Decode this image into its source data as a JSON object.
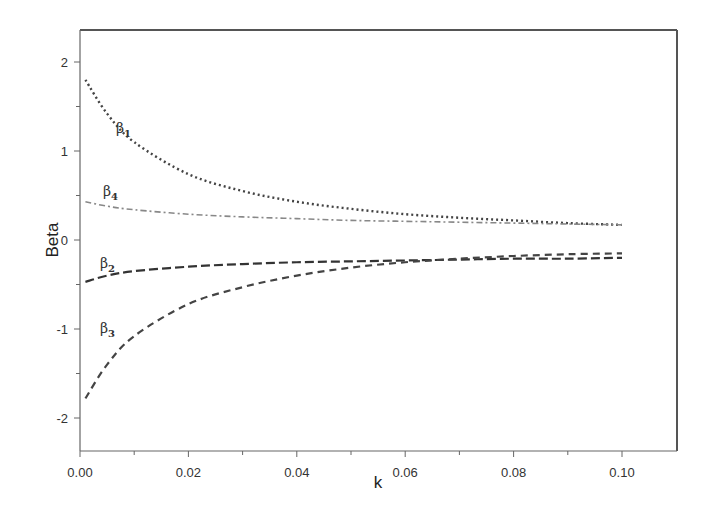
{
  "chart_data": {
    "type": "line",
    "title": "",
    "xlabel": "k",
    "ylabel": "Beta",
    "xlim": [
      0.0,
      0.11
    ],
    "ylim": [
      -2.35,
      2.4
    ],
    "grid": false,
    "legend": "inline labels near curve starts",
    "x_ticks": [
      "0.00",
      "0.02",
      "0.04",
      "0.06",
      "0.08",
      "0.10"
    ],
    "y_ticks": [
      "-2",
      "-1",
      "0",
      "1",
      "2"
    ],
    "x": [
      0.001,
      0.005,
      0.01,
      0.02,
      0.03,
      0.04,
      0.05,
      0.06,
      0.07,
      0.08,
      0.09,
      0.1
    ],
    "series": [
      {
        "name": "β1",
        "label_base": "β",
        "label_sub": "1",
        "style": "dotted",
        "color": "#444444",
        "values": [
          1.8,
          1.42,
          1.1,
          0.74,
          0.55,
          0.43,
          0.35,
          0.29,
          0.25,
          0.22,
          0.19,
          0.17
        ]
      },
      {
        "name": "β4",
        "label_base": "β",
        "label_sub": "4",
        "style": "dashdot",
        "color": "#888888",
        "values": [
          0.43,
          0.38,
          0.34,
          0.29,
          0.26,
          0.24,
          0.22,
          0.21,
          0.2,
          0.19,
          0.18,
          0.17
        ]
      },
      {
        "name": "β2",
        "label_base": "β",
        "label_sub": "2",
        "style": "longdash",
        "color": "#333333",
        "values": [
          -0.47,
          -0.4,
          -0.35,
          -0.3,
          -0.27,
          -0.25,
          -0.24,
          -0.23,
          -0.22,
          -0.21,
          -0.21,
          -0.2
        ]
      },
      {
        "name": "β3",
        "label_base": "β",
        "label_sub": "3",
        "style": "dashed",
        "color": "#444444",
        "values": [
          -1.78,
          -1.4,
          -1.08,
          -0.72,
          -0.53,
          -0.4,
          -0.31,
          -0.25,
          -0.21,
          -0.18,
          -0.16,
          -0.15
        ]
      }
    ]
  }
}
